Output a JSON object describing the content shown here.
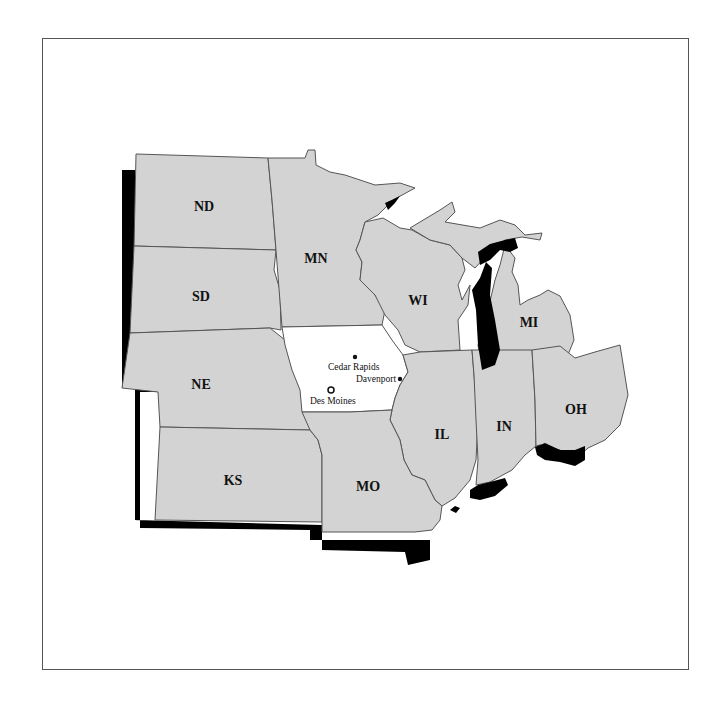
{
  "map": {
    "colors": {
      "state_fill": "#d3d3d3",
      "highlight_fill": "#ffffff",
      "shadow": "#000000",
      "border": "#555555"
    },
    "states": [
      {
        "abbr": "ND"
      },
      {
        "abbr": "SD"
      },
      {
        "abbr": "NE"
      },
      {
        "abbr": "KS"
      },
      {
        "abbr": "MN"
      },
      {
        "abbr": "WI"
      },
      {
        "abbr": "MI"
      },
      {
        "abbr": "IL"
      },
      {
        "abbr": "IN"
      },
      {
        "abbr": "OH"
      },
      {
        "abbr": "MO"
      }
    ],
    "highlighted_state": "Iowa",
    "cities": [
      {
        "name": "Cedar Rapids",
        "marker": "dot"
      },
      {
        "name": "Davenport",
        "marker": "dot"
      },
      {
        "name": "Des Moines",
        "marker": "capital-star"
      }
    ]
  }
}
